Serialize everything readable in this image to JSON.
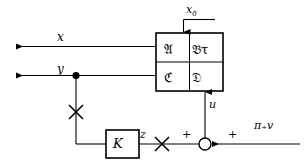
{
  "diagram": {
    "stroke_color": "#000000",
    "background_color": "#ffffff",
    "signals": {
      "x": "x",
      "y": "y",
      "x0": "x",
      "x0_subscript": "0",
      "u": "u",
      "z": "z",
      "disturbance": "π₊v"
    },
    "system_matrix": {
      "label": "system-matrix-box",
      "cells": [
        {
          "name": "A",
          "text": "𝔄"
        },
        {
          "name": "B-tau",
          "text": "𝔅τ"
        },
        {
          "name": "C",
          "text": "ℭ"
        },
        {
          "name": "D",
          "text": "𝔇"
        }
      ]
    },
    "controller": {
      "label": "K",
      "name": "controller-block-K"
    },
    "summing_junction": {
      "name": "summing-junction",
      "signs": [
        "+",
        "+"
      ]
    },
    "markers": {
      "cross_count": 2,
      "junction_dot_count": 1
    }
  }
}
